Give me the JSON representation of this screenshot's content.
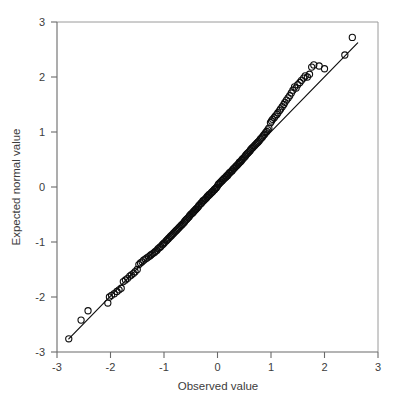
{
  "figure": {
    "background_color": "#ffffff",
    "marker_color": "#0d0d0d",
    "line_color": "#101010",
    "axis_color": "#6a6a6a",
    "text_color": "#3c3c3c"
  },
  "chart_data": {
    "type": "scatter",
    "title": "",
    "subtitle": "",
    "xlabel": "Observed value",
    "ylabel": "Expected normal value",
    "xlim": [
      -3,
      3
    ],
    "ylim": [
      -3,
      3
    ],
    "xticks": [
      -3,
      -2,
      -1,
      0,
      1,
      2,
      3
    ],
    "yticks": [
      -3,
      -2,
      -1,
      0,
      1,
      2,
      3
    ],
    "xtick_labels": [
      "-3",
      "-2",
      "-1",
      "0",
      "1",
      "2",
      "3"
    ],
    "ytick_labels": [
      "-3",
      "-2",
      "-1",
      "0",
      "1",
      "2",
      "3"
    ],
    "grid": false,
    "legend": null,
    "legend_position": "none",
    "annotations": [],
    "reference_line": {
      "label": "normal reference line",
      "x": [
        -2.78,
        2.62
      ],
      "y": [
        -2.76,
        2.62
      ],
      "slope": 1.0,
      "intercept": 0.0
    },
    "marker": {
      "shape": "open-circle",
      "radius_px": 3.1
    },
    "series": [
      {
        "name": "Q-Q points",
        "x": [
          -2.78,
          -2.55,
          -2.42,
          -2.05,
          -2.02,
          -1.98,
          -1.93,
          -1.88,
          -1.84,
          -1.8,
          -1.76,
          -1.72,
          -1.68,
          -1.64,
          -1.61,
          -1.57,
          -1.54,
          -1.5,
          -1.47,
          -1.44,
          -1.41,
          -1.38,
          -1.35,
          -1.32,
          -1.29,
          -1.26,
          -1.24,
          -1.21,
          -1.18,
          -1.16,
          -1.13,
          -1.11,
          -1.08,
          -1.06,
          -1.03,
          -1.01,
          -0.99,
          -0.96,
          -0.94,
          -0.92,
          -0.9,
          -0.88,
          -0.86,
          -0.84,
          -0.82,
          -0.8,
          -0.78,
          -0.76,
          -0.74,
          -0.72,
          -0.7,
          -0.68,
          -0.66,
          -0.64,
          -0.62,
          -0.61,
          -0.59,
          -0.57,
          -0.55,
          -0.53,
          -0.52,
          -0.5,
          -0.48,
          -0.46,
          -0.45,
          -0.43,
          -0.41,
          -0.4,
          -0.38,
          -0.36,
          -0.35,
          -0.33,
          -0.31,
          -0.3,
          -0.28,
          -0.27,
          -0.25,
          -0.23,
          -0.22,
          -0.2,
          -0.19,
          -0.17,
          -0.16,
          -0.14,
          -0.12,
          -0.11,
          -0.09,
          -0.08,
          -0.06,
          -0.05,
          -0.03,
          -0.02,
          0.0,
          0.02,
          0.03,
          0.05,
          0.06,
          0.08,
          0.09,
          0.11,
          0.12,
          0.14,
          0.16,
          0.17,
          0.19,
          0.2,
          0.22,
          0.23,
          0.25,
          0.27,
          0.28,
          0.3,
          0.31,
          0.33,
          0.35,
          0.36,
          0.38,
          0.4,
          0.41,
          0.43,
          0.45,
          0.46,
          0.48,
          0.5,
          0.52,
          0.53,
          0.55,
          0.57,
          0.59,
          0.61,
          0.62,
          0.64,
          0.66,
          0.68,
          0.7,
          0.72,
          0.74,
          0.76,
          0.78,
          0.8,
          0.82,
          0.84,
          0.86,
          0.88,
          0.9,
          0.92,
          0.94,
          0.96,
          0.99,
          1.01,
          1.03,
          1.06,
          1.08,
          1.11,
          1.13,
          1.16,
          1.18,
          1.21,
          1.24,
          1.26,
          1.29,
          1.32,
          1.35,
          1.38,
          1.41,
          1.44,
          1.47,
          1.5,
          1.54,
          1.57,
          1.61,
          1.64,
          1.68,
          1.72,
          1.76,
          1.8,
          1.9,
          2.0,
          2.38,
          2.52
        ],
        "y": [
          -2.76,
          -2.42,
          -2.25,
          -2.11,
          -2.0,
          -1.97,
          -1.94,
          -1.9,
          -1.87,
          -1.84,
          -1.72,
          -1.69,
          -1.66,
          -1.62,
          -1.6,
          -1.57,
          -1.54,
          -1.5,
          -1.41,
          -1.38,
          -1.36,
          -1.33,
          -1.31,
          -1.29,
          -1.27,
          -1.25,
          -1.23,
          -1.21,
          -1.19,
          -1.17,
          -1.15,
          -1.12,
          -1.1,
          -1.08,
          -1.05,
          -1.03,
          -1.01,
          -0.98,
          -0.96,
          -0.94,
          -0.92,
          -0.9,
          -0.88,
          -0.86,
          -0.84,
          -0.82,
          -0.8,
          -0.78,
          -0.76,
          -0.74,
          -0.72,
          -0.7,
          -0.68,
          -0.66,
          -0.64,
          -0.62,
          -0.6,
          -0.58,
          -0.56,
          -0.54,
          -0.52,
          -0.5,
          -0.48,
          -0.47,
          -0.45,
          -0.43,
          -0.41,
          -0.4,
          -0.38,
          -0.36,
          -0.34,
          -0.32,
          -0.3,
          -0.29,
          -0.27,
          -0.25,
          -0.24,
          -0.22,
          -0.21,
          -0.19,
          -0.17,
          -0.16,
          -0.14,
          -0.13,
          -0.11,
          -0.1,
          -0.08,
          -0.07,
          -0.05,
          -0.04,
          -0.02,
          -0.01,
          0.02,
          0.05,
          0.06,
          0.08,
          0.09,
          0.11,
          0.12,
          0.14,
          0.15,
          0.17,
          0.18,
          0.2,
          0.21,
          0.23,
          0.25,
          0.26,
          0.28,
          0.29,
          0.31,
          0.33,
          0.34,
          0.36,
          0.38,
          0.39,
          0.41,
          0.43,
          0.45,
          0.46,
          0.48,
          0.5,
          0.52,
          0.54,
          0.56,
          0.58,
          0.6,
          0.62,
          0.64,
          0.66,
          0.68,
          0.7,
          0.72,
          0.74,
          0.76,
          0.78,
          0.8,
          0.82,
          0.84,
          0.87,
          0.89,
          0.91,
          0.94,
          0.96,
          0.99,
          1.01,
          1.04,
          1.07,
          1.17,
          1.2,
          1.23,
          1.26,
          1.29,
          1.32,
          1.35,
          1.39,
          1.42,
          1.46,
          1.5,
          1.54,
          1.58,
          1.62,
          1.66,
          1.71,
          1.76,
          1.82,
          1.8,
          1.86,
          1.9,
          1.94,
          1.98,
          2.02,
          2.0,
          2.05,
          2.18,
          2.22,
          2.2,
          2.15,
          2.4,
          2.72
        ]
      }
    ]
  }
}
